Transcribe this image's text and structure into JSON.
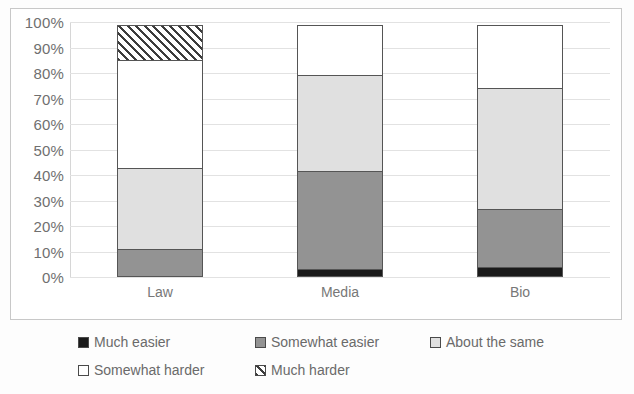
{
  "chart_data": {
    "type": "bar",
    "subtype": "stacked-bar-100-percent",
    "title": "",
    "xlabel": "",
    "ylabel": "",
    "ylim": [
      0,
      100
    ],
    "ytick_labels": [
      "100%",
      "90%",
      "80%",
      "70%",
      "60%",
      "50%",
      "40%",
      "30%",
      "20%",
      "10%",
      "0%"
    ],
    "ytick_values": [
      100,
      90,
      80,
      70,
      60,
      50,
      40,
      30,
      20,
      10,
      0
    ],
    "grid": true,
    "legend_position": "bottom",
    "categories": [
      "Law",
      "Media",
      "Bio"
    ],
    "series": [
      {
        "name": "Much easier",
        "color": "#1a1a1a",
        "pattern": "solid",
        "values": [
          0,
          3,
          4
        ]
      },
      {
        "name": "Somewhat easier",
        "color": "#939393",
        "pattern": "solid",
        "values": [
          11,
          39,
          23
        ]
      },
      {
        "name": "About the same",
        "color": "#e0e0e0",
        "pattern": "solid",
        "values": [
          32,
          38,
          48
        ]
      },
      {
        "name": "Somewhat harder",
        "color": "#ffffff",
        "pattern": "solid",
        "values": [
          43,
          20,
          25
        ]
      },
      {
        "name": "Much harder",
        "color": "#ffffff",
        "pattern": "hatch",
        "values": [
          14,
          0,
          0
        ]
      }
    ]
  },
  "axis": {
    "y_ticks": [
      {
        "label": "100%",
        "value": 100
      },
      {
        "label": "90%",
        "value": 90
      },
      {
        "label": "80%",
        "value": 80
      },
      {
        "label": "70%",
        "value": 70
      },
      {
        "label": "60%",
        "value": 60
      },
      {
        "label": "50%",
        "value": 50
      },
      {
        "label": "40%",
        "value": 40
      },
      {
        "label": "30%",
        "value": 30
      },
      {
        "label": "20%",
        "value": 20
      },
      {
        "label": "10%",
        "value": 10
      },
      {
        "label": "0%",
        "value": 0
      }
    ],
    "categories": [
      "Law",
      "Media",
      "Bio"
    ]
  },
  "legend": {
    "items": [
      {
        "label": "Much easier",
        "key": "much-easier"
      },
      {
        "label": "Somewhat easier",
        "key": "somewhat-easier"
      },
      {
        "label": "About the same",
        "key": "about-same"
      },
      {
        "label": "Somewhat harder",
        "key": "somewhat-harder"
      },
      {
        "label": "Much harder",
        "key": "much-harder"
      }
    ]
  }
}
